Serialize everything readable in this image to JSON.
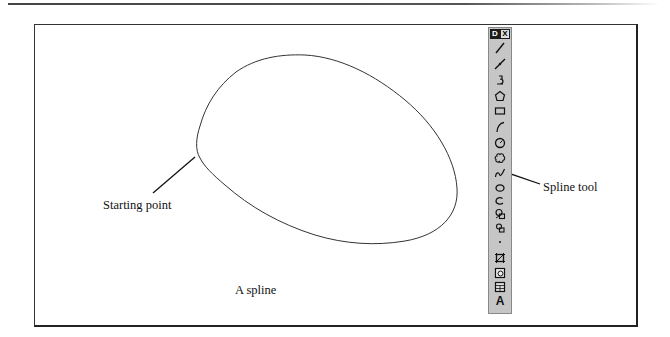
{
  "figure": {
    "caption": "A spline",
    "callouts": {
      "starting_point": "Starting point",
      "spline_tool": "Spline tool"
    }
  },
  "toolbar": {
    "title_letter": "D",
    "close_glyph": "X",
    "tools": [
      {
        "name": "line-icon",
        "top": 13
      },
      {
        "name": "construction-line-icon",
        "top": 29
      },
      {
        "name": "polyline-icon",
        "top": 45
      },
      {
        "name": "polygon-icon",
        "top": 61
      },
      {
        "name": "rectangle-icon",
        "top": 76
      },
      {
        "name": "arc-icon",
        "top": 92
      },
      {
        "name": "circle-icon",
        "top": 108
      },
      {
        "name": "revision-cloud-icon",
        "top": 123
      },
      {
        "name": "spline-icon",
        "top": 138
      },
      {
        "name": "ellipse-icon",
        "top": 153
      },
      {
        "name": "ellipse-arc-icon",
        "top": 166
      },
      {
        "name": "insert-block-icon",
        "top": 179
      },
      {
        "name": "make-block-icon",
        "top": 193
      },
      {
        "name": "point-icon",
        "top": 207
      },
      {
        "name": "hatch-icon",
        "top": 223
      },
      {
        "name": "region-icon",
        "top": 238
      },
      {
        "name": "table-icon",
        "top": 252
      },
      {
        "name": "multiline-text-icon",
        "top": 266,
        "label": "A"
      }
    ]
  },
  "colors": {
    "toolbar_bg": "#c6c6c6",
    "title_bar": "#1c1c1c",
    "stroke": "#222222"
  }
}
